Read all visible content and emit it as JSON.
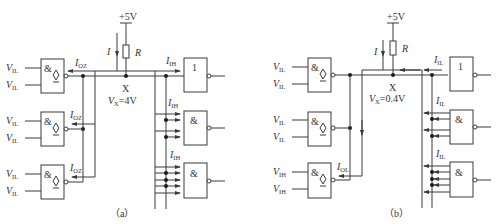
{
  "figure": {
    "panels": [
      {
        "id": "a",
        "caption": "（a）",
        "supply": "+5V",
        "resistor_label": "R",
        "current_label": "I",
        "node_label": "X",
        "node_voltage": "V_X=4V",
        "node_voltage_main": "V",
        "node_voltage_sub": "X",
        "node_voltage_value": "=4V",
        "driver_gates": [
          {
            "symbol": "&",
            "type": "tristate-nand",
            "inputs": [
              "V_IL",
              "V_IL"
            ],
            "output_current": "I_OZ"
          },
          {
            "symbol": "&",
            "type": "tristate-nand",
            "inputs": [
              "V_IL",
              "V_IL"
            ],
            "output_current": "I_OZ"
          },
          {
            "symbol": "&",
            "type": "tristate-nand",
            "inputs": [
              "V_IL",
              "V_IL"
            ],
            "output_current": "I_OZ"
          }
        ],
        "load_gates": [
          {
            "symbol": "1",
            "type": "inverter",
            "input_current": "I_IH"
          },
          {
            "symbol": "&",
            "type": "nand",
            "input_current": "I_IH"
          },
          {
            "symbol": "&",
            "type": "nand",
            "input_current": "I_IH"
          }
        ],
        "input_label_main": "V",
        "input_label_sub": "IL",
        "current_main": "I",
        "driver_current_sub": "OZ",
        "load_current_sub": "IH"
      },
      {
        "id": "b",
        "caption": "（b）",
        "supply": "+5V",
        "resistor_label": "R",
        "current_label": "I",
        "node_label": "X",
        "node_voltage": "V_X=0.4V",
        "node_voltage_main": "V",
        "node_voltage_sub": "X",
        "node_voltage_value": "=0.4V",
        "driver_gates": [
          {
            "symbol": "&",
            "type": "tristate-nand",
            "inputs": [
              "V_IL",
              "V_IL"
            ]
          },
          {
            "symbol": "&",
            "type": "tristate-nand",
            "inputs": [
              "V_IL",
              "V_IL"
            ]
          },
          {
            "symbol": "&",
            "type": "tristate-nand",
            "inputs": [
              "V_IH",
              "V_IH"
            ],
            "output_current": "I_OL"
          }
        ],
        "load_gates": [
          {
            "symbol": "1",
            "type": "inverter",
            "input_current": "I_IL"
          },
          {
            "symbol": "&",
            "type": "nand",
            "input_current": "I_IL"
          },
          {
            "symbol": "&",
            "type": "nand",
            "input_current": "I_IL"
          }
        ],
        "input_label_main": "V",
        "input_low_sub": "IL",
        "input_high_sub": "IH",
        "current_main": "I",
        "driver_current_sub": "OL",
        "load_current_sub": "IL"
      }
    ]
  }
}
